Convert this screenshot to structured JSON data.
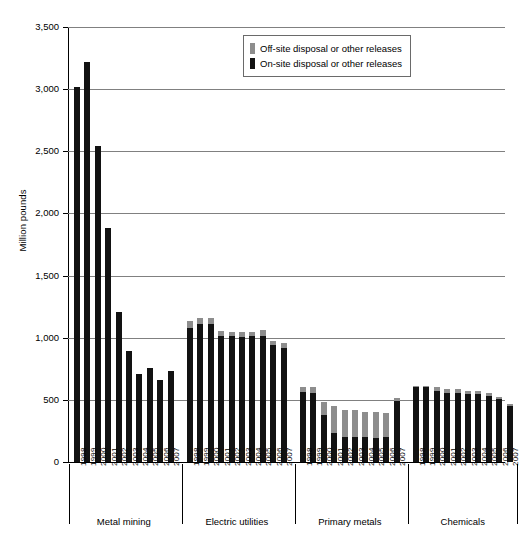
{
  "chart_data": {
    "type": "bar",
    "title": "",
    "xlabel": "",
    "ylabel": "Million pounds",
    "ylim": [
      0,
      3500
    ],
    "ytick_values": [
      0,
      500,
      1000,
      1500,
      2000,
      2500,
      3000,
      3500
    ],
    "ytick_labels": [
      "0",
      "500",
      "1,000",
      "1,500",
      "2,000",
      "2,500",
      "3,000",
      "3,500"
    ],
    "grid": true,
    "stacked": true,
    "legend_position": "top-right",
    "series": [
      {
        "name": "On-site disposal or other releases",
        "color": "#121212",
        "values": [
          3020,
          3220,
          2540,
          1880,
          1210,
          890,
          710,
          760,
          660,
          730,
          1080,
          1110,
          1110,
          1015,
          1010,
          1005,
          1010,
          1010,
          940,
          920,
          560,
          555,
          380,
          235,
          205,
          205,
          200,
          195,
          200,
          490,
          600,
          600,
          570,
          555,
          555,
          545,
          545,
          530,
          505,
          450
        ]
      },
      {
        "name": "Off-site disposal or other releases",
        "color": "#8d8d8d",
        "values": [
          0,
          0,
          0,
          0,
          0,
          0,
          0,
          0,
          0,
          0,
          55,
          45,
          50,
          40,
          40,
          40,
          40,
          50,
          35,
          35,
          45,
          45,
          100,
          215,
          210,
          210,
          205,
          205,
          195,
          25,
          15,
          15,
          30,
          35,
          30,
          30,
          25,
          25,
          20,
          20
        ]
      }
    ],
    "groups": [
      {
        "name": "Metal mining",
        "years": [
          "1998",
          "1999",
          "2000",
          "2001",
          "2002",
          "2003",
          "2004",
          "2005",
          "2006",
          "2007"
        ]
      },
      {
        "name": "Electric utilities",
        "years": [
          "1998",
          "1999",
          "2000",
          "2001",
          "2002",
          "2003",
          "2004",
          "2005",
          "2006",
          "2007"
        ]
      },
      {
        "name": "Primary metals",
        "years": [
          "1998",
          "1999",
          "2000",
          "2001",
          "2002",
          "2003",
          "2004",
          "2005",
          "2006",
          "2007"
        ]
      },
      {
        "name": "Chemicals",
        "years": [
          "1998",
          "1999",
          "2000",
          "2001",
          "2002",
          "2003",
          "2004",
          "2005",
          "2006",
          "2007"
        ]
      }
    ]
  },
  "legend": {
    "items": [
      {
        "label": "Off-site disposal or other releases",
        "swatch": "off"
      },
      {
        "label": "On-site disposal or other releases",
        "swatch": "on"
      }
    ]
  },
  "caption": ""
}
